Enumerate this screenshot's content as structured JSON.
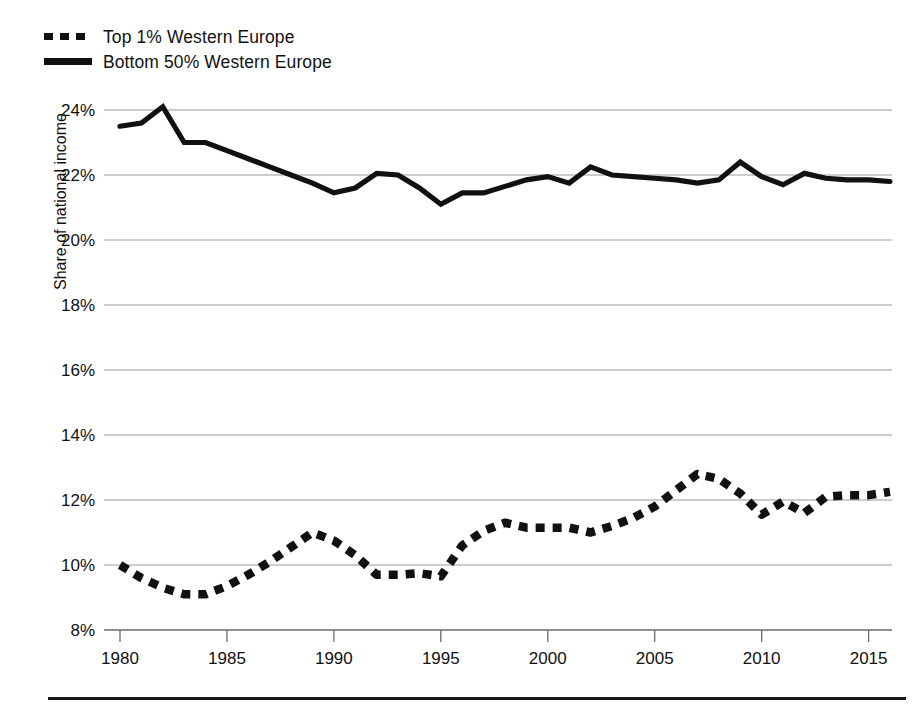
{
  "chart_data": {
    "type": "line",
    "title": "",
    "subtitle": "",
    "xlabel": "",
    "ylabel": "Share of national income",
    "xlim": [
      1980,
      2016
    ],
    "ylim": [
      8,
      24.6
    ],
    "grid": "horizontal",
    "legend_position": "top-left",
    "y_ticks": [
      "8%",
      "10%",
      "12%",
      "14%",
      "16%",
      "18%",
      "20%",
      "22%",
      "24%"
    ],
    "y_tick_values": [
      8,
      10,
      12,
      14,
      16,
      18,
      20,
      22,
      24
    ],
    "x_ticks": [
      "1980",
      "1985",
      "1990",
      "1995",
      "2000",
      "2005",
      "2010",
      "2015"
    ],
    "x_tick_values": [
      1980,
      1985,
      1990,
      1995,
      2000,
      2005,
      2010,
      2015
    ],
    "x": [
      1980,
      1981,
      1982,
      1983,
      1984,
      1985,
      1986,
      1987,
      1988,
      1989,
      1990,
      1991,
      1992,
      1993,
      1994,
      1995,
      1996,
      1997,
      1998,
      1999,
      2000,
      2001,
      2002,
      2003,
      2004,
      2005,
      2006,
      2007,
      2008,
      2009,
      2010,
      2011,
      2012,
      2013,
      2014,
      2015,
      2016
    ],
    "series": [
      {
        "name": "Top 1% Western Europe",
        "style": "dotted",
        "color": "#111111",
        "values": [
          10.0,
          9.6,
          9.3,
          9.1,
          9.1,
          9.35,
          9.7,
          10.1,
          10.55,
          11.0,
          10.75,
          10.3,
          9.7,
          9.7,
          9.75,
          9.65,
          10.6,
          11.05,
          11.3,
          11.15,
          11.15,
          11.15,
          11.0,
          11.2,
          11.45,
          11.8,
          12.3,
          12.8,
          12.65,
          12.2,
          11.55,
          11.95,
          11.6,
          12.1,
          12.15,
          12.15,
          12.25
        ]
      },
      {
        "name": "Bottom 50% Western Europe",
        "style": "solid",
        "color": "#111111",
        "values": [
          23.5,
          23.6,
          24.1,
          23.0,
          23.0,
          22.75,
          22.5,
          22.25,
          22.0,
          21.75,
          21.45,
          21.6,
          22.05,
          22.0,
          21.6,
          21.1,
          21.45,
          21.45,
          21.65,
          21.85,
          21.95,
          21.75,
          22.25,
          22.0,
          21.95,
          21.9,
          21.85,
          21.75,
          21.85,
          22.4,
          21.95,
          21.7,
          22.05,
          21.9,
          21.85,
          21.85,
          21.8
        ]
      }
    ]
  },
  "legend": {
    "items": [
      {
        "label": "Top 1% Western Europe",
        "style": "dashed"
      },
      {
        "label": "Bottom 50% Western Europe",
        "style": "solid"
      }
    ]
  },
  "colors": {
    "line": "#111111",
    "grid": "#9a9a9a",
    "axis": "#6b6b6b",
    "background": "#ffffff",
    "rule": "#1a1a1a"
  }
}
